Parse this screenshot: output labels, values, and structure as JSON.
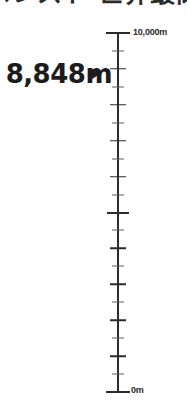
{
  "header": {
    "title": "エベレスト 世界最高峰",
    "title_note": "cropped-at-top"
  },
  "callout": {
    "value_label": "8,848m",
    "marker_icon": "right-triangle-marker-icon"
  },
  "axis": {
    "top_label": "10,000m",
    "bottom_label": "0m"
  },
  "colors": {
    "ink": "#2b2b2b",
    "value_ink": "#1c1c1c",
    "minor_tick": "#5d5d5d",
    "background": "#ffffff"
  },
  "chart_data": {
    "type": "bar",
    "title": "エベレスト 世界最高峰",
    "subtitle": "",
    "orientation": "vertical",
    "xlabel": "",
    "ylabel": "Elevation (m)",
    "ylim": [
      0,
      10000
    ],
    "grid": false,
    "legend": false,
    "tick_interval": 500,
    "major_tick_interval": 1000,
    "categories": [
      "Mount Everest"
    ],
    "values": [
      8848
    ],
    "annotations": [
      {
        "label": "8,848m",
        "value": 8848,
        "marker": "right-triangle",
        "position": "left-of-axis"
      }
    ],
    "axis_ticks": [
      {
        "value": 10000,
        "label": "10,000m",
        "size": "cap"
      },
      {
        "value": 9500,
        "label": "",
        "size": "minor"
      },
      {
        "value": 9000,
        "label": "",
        "size": "major"
      },
      {
        "value": 8500,
        "label": "",
        "size": "minor"
      },
      {
        "value": 8000,
        "label": "",
        "size": "major"
      },
      {
        "value": 7500,
        "label": "",
        "size": "minor"
      },
      {
        "value": 7000,
        "label": "",
        "size": "major"
      },
      {
        "value": 6500,
        "label": "",
        "size": "minor"
      },
      {
        "value": 6000,
        "label": "",
        "size": "major"
      },
      {
        "value": 5500,
        "label": "",
        "size": "minor"
      },
      {
        "value": 5000,
        "label": "",
        "size": "half"
      },
      {
        "value": 4500,
        "label": "",
        "size": "minor"
      },
      {
        "value": 4000,
        "label": "",
        "size": "major"
      },
      {
        "value": 3500,
        "label": "",
        "size": "minor"
      },
      {
        "value": 3000,
        "label": "",
        "size": "major"
      },
      {
        "value": 2500,
        "label": "",
        "size": "minor"
      },
      {
        "value": 2000,
        "label": "",
        "size": "major"
      },
      {
        "value": 1500,
        "label": "",
        "size": "minor"
      },
      {
        "value": 1000,
        "label": "",
        "size": "major"
      },
      {
        "value": 500,
        "label": "",
        "size": "minor"
      },
      {
        "value": 0,
        "label": "0m",
        "size": "cap"
      }
    ]
  }
}
